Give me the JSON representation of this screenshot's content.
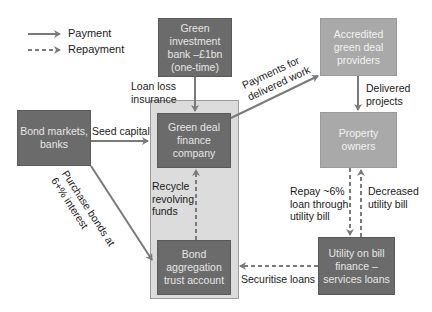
{
  "legend": {
    "payment": "Payment",
    "repayment": "Repayment"
  },
  "nodes": {
    "green_investment_bank": "Green investment bank –£1bn (one-time)",
    "accredited_providers": "Accredited green deal providers",
    "bond_markets": "Bond markets, banks",
    "finance_company": "Green deal finance company",
    "property_owners": "Property owners",
    "bond_aggregation": "Bond aggregation trust account",
    "utility": "Utility on bill finance – services loans"
  },
  "edges": {
    "loan_loss": "Loan loss insurance",
    "seed_capital": "Seed capital",
    "payments_delivered": "Payments for delivered work",
    "delivered_projects": "Delivered projects",
    "purchase_bonds": "Purchase bonds at 6+% interest",
    "recycle_funds": "Recycle revolving funds",
    "repay_loan": "Repay ~6% loan through utility bill",
    "decreased_bill": "Decreased utility bill",
    "securitise": "Securitise loans"
  },
  "colors": {
    "dark_box": "#6b6b6b",
    "light_box": "#a9a9a9",
    "container": "#dcdcdc",
    "arrow": "#7a7a7a"
  }
}
